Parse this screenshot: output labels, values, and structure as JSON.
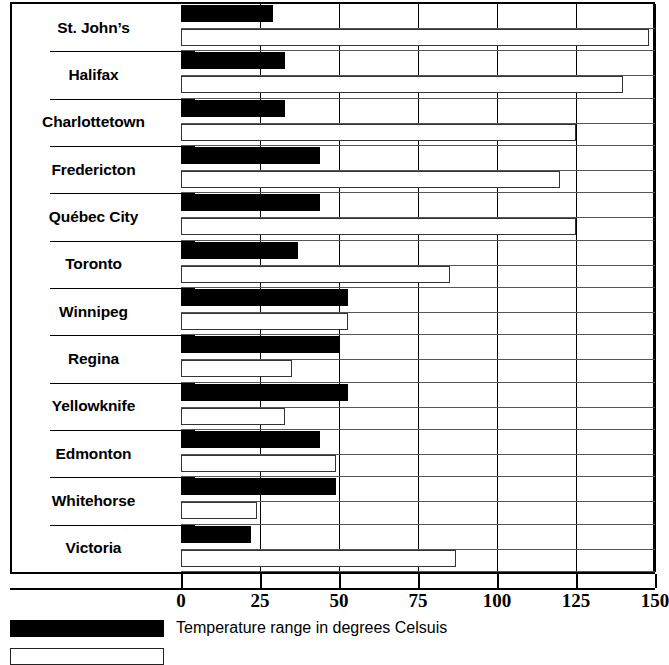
{
  "chart_data": {
    "type": "bar",
    "orientation": "horizontal",
    "title": "",
    "xlabel": "",
    "ylabel": "",
    "xlim": [
      0,
      150
    ],
    "xticks": [
      0,
      25,
      50,
      75,
      100,
      125,
      150
    ],
    "xticklabels": [
      "0",
      "25",
      "50",
      "75",
      "100",
      "125",
      "150"
    ],
    "grid": true,
    "grid_axis": "x",
    "legend_position": "bottom-left",
    "categories": [
      "St. John’s",
      "Halifax",
      "Charlottetown",
      "Fredericton",
      "Québec City",
      "Toronto",
      "Winnipeg",
      "Regina",
      "Yellowknife",
      "Edmonton",
      "Whitehorse",
      "Victoria"
    ],
    "series": [
      {
        "name": "Temperature range in degrees Celsuis",
        "color": "#000000",
        "style": "filled",
        "values": [
          29,
          33,
          33,
          44,
          44,
          37,
          53,
          50,
          53,
          44,
          49,
          22
        ]
      },
      {
        "name": "",
        "color": "#ffffff",
        "style": "hollow",
        "values": [
          148,
          140,
          125,
          120,
          125,
          85,
          53,
          35,
          33,
          49,
          24,
          87
        ]
      }
    ]
  },
  "legend": {
    "items": [
      {
        "swatch": "filled",
        "label": "Temperature range in degrees Celsuis"
      },
      {
        "swatch": "hollow",
        "label": ""
      }
    ]
  },
  "colors": {
    "bar_filled": "#000000",
    "bar_hollow": "#ffffff",
    "axis": "#000000",
    "background": "#ffffff"
  }
}
